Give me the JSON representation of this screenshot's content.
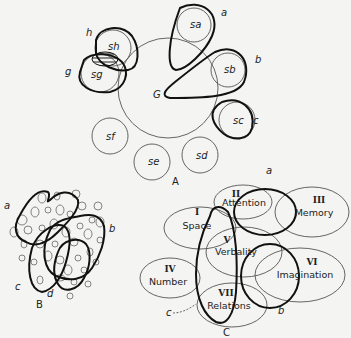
{
  "figure_a": {
    "caption": "A",
    "general_factor": "G",
    "specifics": [
      "sa",
      "sb",
      "sc",
      "sd",
      "se",
      "sf",
      "sg",
      "sh"
    ],
    "group_labels": [
      "a",
      "b",
      "c",
      "g",
      "h"
    ]
  },
  "figure_b": {
    "caption": "B",
    "group_labels": [
      "a",
      "b",
      "c",
      "d"
    ]
  },
  "figure_c": {
    "caption": "C",
    "factors": [
      {
        "numeral": "I",
        "name": "Space"
      },
      {
        "numeral": "II",
        "name": "Attention"
      },
      {
        "numeral": "III",
        "name": "Memory"
      },
      {
        "numeral": "IV",
        "name": "Number"
      },
      {
        "numeral": "V",
        "name": "Verbality"
      },
      {
        "numeral": "VI",
        "name": "Imagination"
      },
      {
        "numeral": "VII",
        "name": "Relations"
      }
    ],
    "group_labels": [
      "a",
      "b",
      "c"
    ]
  }
}
